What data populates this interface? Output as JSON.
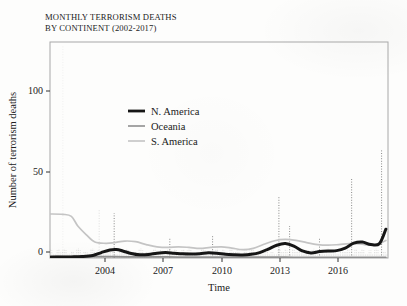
{
  "title": {
    "line1": "MONTHLY TERRORISM DEATHS",
    "line2": "BY CONTINENT (2002-2017)",
    "full": "MONTHLY TERRORISM DEATHS\nBY CONTINENT (2002-2017)"
  },
  "colors": {
    "n_america": "#161616",
    "oceania": "#8f8f8f",
    "s_america": "#c4c4c4",
    "axis": "#202020",
    "frame": "#a8a8a8",
    "background": "#fdfdfc"
  },
  "axes": {
    "x_label": "Time",
    "y_label": "Number of terrorism deaths",
    "x_ticks": [
      "2004",
      "2007",
      "2010",
      "2013",
      "2016"
    ],
    "y_ticks": [
      "0",
      "50",
      "100"
    ]
  },
  "legend": {
    "entries": [
      {
        "label": "N. America",
        "color": "#161616",
        "width": 2.8
      },
      {
        "label": "Oceania",
        "color": "#8f8f8f",
        "width": 1.6
      },
      {
        "label": "S. America",
        "color": "#c4c4c4",
        "width": 1.6
      }
    ]
  },
  "chart_data": {
    "type": "line",
    "title": "MONTHLY TERRORISM DEATHS BY CONTINENT (2002-2017)",
    "xlabel": "Time",
    "ylabel": "Number of terrorism deaths",
    "xlim": [
      2002.0,
      2017.8
    ],
    "ylim": [
      0,
      135
    ],
    "grid": false,
    "legend_position": "inside-upper-center",
    "x_tick_values": [
      2004,
      2007,
      2010,
      2013,
      2016
    ],
    "y_tick_values": [
      0,
      50,
      100
    ],
    "note": "Heavy solid curves are smoothed trends; faint dotted vertical spikes are the raw monthly counts.",
    "series": [
      {
        "name": "N. America",
        "color": "#161616",
        "style": "smoothed-solid-thick",
        "x": [
          2002.0,
          2002.5,
          2003.0,
          2003.5,
          2004.0,
          2004.4,
          2004.8,
          2005.1,
          2005.4,
          2005.8,
          2006.2,
          2006.6,
          2007.0,
          2007.4,
          2007.8,
          2008.2,
          2008.6,
          2009.0,
          2009.4,
          2009.8,
          2010.2,
          2010.6,
          2011.0,
          2011.4,
          2011.8,
          2012.2,
          2012.6,
          2013.0,
          2013.4,
          2013.8,
          2014.2,
          2014.6,
          2015.0,
          2015.4,
          2015.8,
          2016.2,
          2016.6,
          2017.0,
          2017.4,
          2017.7
        ],
        "y": [
          0.5,
          0.6,
          0.7,
          0.9,
          1.6,
          3.4,
          5.0,
          5.3,
          4.4,
          2.8,
          2.0,
          2.2,
          3.0,
          3.4,
          3.0,
          2.6,
          2.5,
          2.7,
          3.3,
          3.0,
          2.3,
          2.0,
          1.9,
          2.3,
          3.4,
          5.6,
          8.0,
          9.0,
          7.4,
          4.4,
          3.2,
          4.0,
          4.4,
          4.6,
          6.2,
          9.3,
          10.0,
          8.4,
          9.0,
          18.0
        ]
      },
      {
        "name": "Oceania",
        "color": "#8f8f8f",
        "style": "smoothed-solid",
        "x": [
          2002.0,
          2003.0,
          2004.0,
          2005.0,
          2006.0,
          2007.0,
          2008.0,
          2009.0,
          2010.0,
          2011.0,
          2012.0,
          2012.6,
          2013.0,
          2013.6,
          2014.2,
          2015.0,
          2015.8,
          2016.4,
          2017.0,
          2017.7
        ],
        "y": [
          1.0,
          0.9,
          0.8,
          0.8,
          0.7,
          0.7,
          0.6,
          0.6,
          0.5,
          0.5,
          0.5,
          0.5,
          0.5,
          0.4,
          0.4,
          0.4,
          0.4,
          0.4,
          0.4,
          0.4
        ]
      },
      {
        "name": "S. America",
        "color": "#c4c4c4",
        "style": "smoothed-solid",
        "x": [
          2002.0,
          2002.6,
          2003.0,
          2003.3,
          2003.7,
          2004.1,
          2004.6,
          2005.0,
          2005.5,
          2006.0,
          2006.5,
          2007.0,
          2007.5,
          2008.0,
          2008.5,
          2009.0,
          2009.5,
          2010.0,
          2010.5,
          2011.0,
          2011.5,
          2012.0,
          2012.5,
          2013.0,
          2013.5,
          2014.0,
          2014.5,
          2015.0,
          2015.5,
          2016.0,
          2016.5,
          2017.0,
          2017.4,
          2017.7
        ],
        "y": [
          27.5,
          27.3,
          26.0,
          20.0,
          14.5,
          10.0,
          9.2,
          9.6,
          10.6,
          10.2,
          8.4,
          7.0,
          6.6,
          7.0,
          6.6,
          6.0,
          6.6,
          7.0,
          6.2,
          5.2,
          6.0,
          8.6,
          10.8,
          11.6,
          11.0,
          9.6,
          8.4,
          8.0,
          8.4,
          9.0,
          8.8,
          8.0,
          9.0,
          11.0
        ]
      }
    ],
    "raw_spikes": [
      {
        "series": "S. America",
        "x": 2002.6,
        "y": 133
      },
      {
        "series": "S. America",
        "x": 2004.3,
        "y": 30
      },
      {
        "series": "N. America",
        "x": 2005.0,
        "y": 28
      },
      {
        "series": "N. America",
        "x": 2007.6,
        "y": 12
      },
      {
        "series": "N. America",
        "x": 2009.6,
        "y": 14
      },
      {
        "series": "N. America",
        "x": 2012.7,
        "y": 38
      },
      {
        "series": "N. America",
        "x": 2013.2,
        "y": 20
      },
      {
        "series": "N. America",
        "x": 2014.6,
        "y": 12
      },
      {
        "series": "N. America",
        "x": 2016.1,
        "y": 50
      },
      {
        "series": "N. America",
        "x": 2017.5,
        "y": 68
      }
    ]
  }
}
